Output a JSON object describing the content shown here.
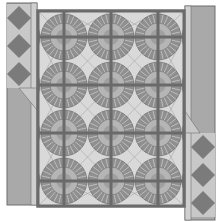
{
  "title": "Quilt pattern preview",
  "colors": {
    "background": "#ffffff",
    "border_fill": "#a9a9a9",
    "border_outline": "#6e6e6e",
    "border_light": "#cfcfcf",
    "diamond_dark": "#7b7b7b",
    "diamond_light": "#c8c8c8",
    "sashing": "#6a6a6a",
    "block_light": "#d9d9d9",
    "block_lighter": "#ebebeb",
    "fan_ring": "#8f8f8f",
    "fan_ring_dark": "#707070",
    "fan_inner": "#b5b5b5",
    "fan_center": "#a0a0a0"
  },
  "quilt": {
    "panel": {
      "x": 37,
      "y": 10,
      "w": 148,
      "h": 197
    },
    "sashing_x": [
      38,
      64,
      111,
      158,
      184
    ],
    "sashing_y": [
      11,
      37,
      85,
      133,
      181,
      206
    ],
    "fan_centers_x": [
      64,
      111,
      158
    ],
    "fan_centers_y": [
      37,
      85,
      133,
      181
    ],
    "fan_radius_outer": 23,
    "fan_radius_inner": 14
  },
  "left_border": {
    "x": 7,
    "y": 3,
    "w": 30,
    "h": 202,
    "diamond_count": 3,
    "diamond_top": 4,
    "diamond_size": 28
  },
  "right_border": {
    "x": 185,
    "y": 6,
    "w": 30,
    "h": 214,
    "diamond_count": 3,
    "diamond_top": 133,
    "diamond_size": 28
  }
}
